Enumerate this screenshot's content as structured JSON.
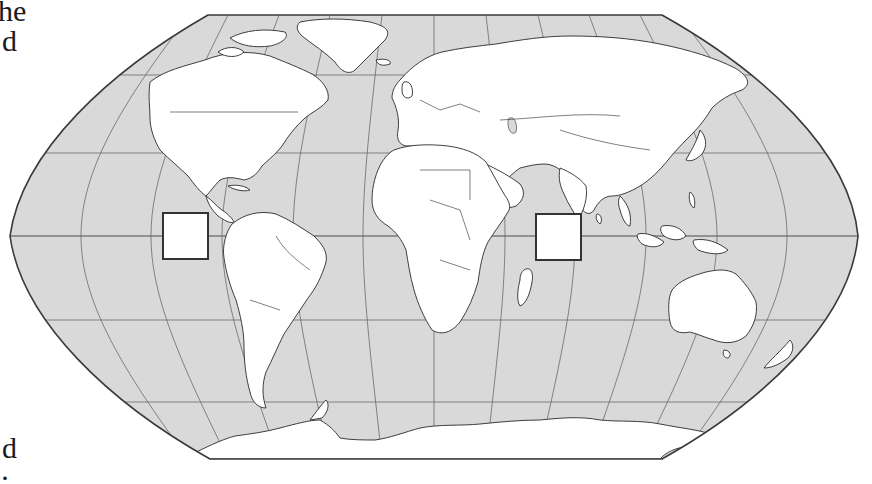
{
  "text_fragments": {
    "top_line_1": "he",
    "top_line_2": "d",
    "bottom_line_1": "d",
    "bottom_line_2": "·"
  },
  "map": {
    "projection": "Robinson-style world outline map",
    "colors": {
      "ocean": "#d9d9d9",
      "land": "#ffffff",
      "outline": "#3a3a3a",
      "graticule": "#6a6a6a"
    },
    "graticule": {
      "latitudes_deg": [
        60,
        30,
        0,
        -30,
        -60
      ],
      "meridian_spacing_deg": 30
    },
    "label_boxes": [
      {
        "id": "box-pacific",
        "location": "Eastern Pacific Ocean, on the equator west of South America",
        "text": ""
      },
      {
        "id": "box-indian",
        "location": "Indian Ocean, on the equator east of Africa",
        "text": ""
      }
    ]
  }
}
